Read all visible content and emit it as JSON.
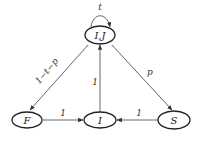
{
  "nodes": {
    "ij": {
      "label": "I,J"
    },
    "f": {
      "label": "F"
    },
    "i": {
      "label": "I"
    },
    "s": {
      "label": "S"
    }
  },
  "edges": {
    "self_loop_ij": {
      "from": "I,J",
      "to": "I,J",
      "label": "t"
    },
    "ij_to_f": {
      "from": "I,J",
      "to": "F",
      "label": "1−t−p"
    },
    "ij_to_s": {
      "from": "I,J",
      "to": "S",
      "label": "p"
    },
    "i_to_ij": {
      "from": "I",
      "to": "I,J",
      "label": "1"
    },
    "f_to_i": {
      "from": "F",
      "to": "I",
      "label": "1"
    },
    "s_to_i": {
      "from": "S",
      "to": "I",
      "label": "1"
    }
  }
}
